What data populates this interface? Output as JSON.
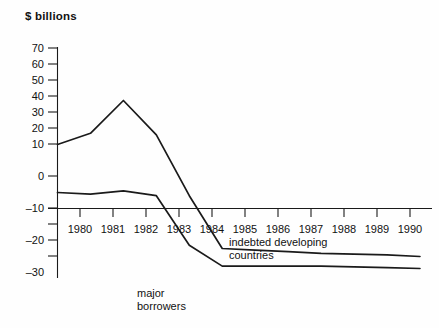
{
  "chart_data": {
    "type": "line",
    "title": "",
    "ylabel": "$ billions",
    "xlabel": "",
    "ylim": [
      -40,
      72
    ],
    "xlim": [
      1979,
      1990
    ],
    "grid": false,
    "legend": "inline-annotations",
    "yticks": [
      70,
      60,
      50,
      40,
      30,
      20,
      10,
      0,
      -10,
      -20,
      -30
    ],
    "ytick_labels": [
      "70",
      "60",
      "50",
      "40",
      "30",
      "20",
      "10",
      "0",
      "–10",
      "–20",
      "–30"
    ],
    "xticks": [
      1980,
      1981,
      1982,
      1983,
      1984,
      1985,
      1986,
      1987,
      1988,
      1989,
      1990
    ],
    "xtick_labels": [
      "1980",
      "1981",
      "1982",
      "1983",
      "1984",
      "1985",
      "1986",
      "1987",
      "1988",
      "1989",
      "1990"
    ],
    "x": [
      1979,
      1980,
      1981,
      1982,
      1983,
      1984,
      1985,
      1986,
      1987,
      1988,
      1989,
      1990
    ],
    "series": [
      {
        "name": "indebted developing countries",
        "values": [
          40,
          47,
          67.5,
          46,
          8,
          -25,
          -26,
          -27,
          -28,
          -28.5,
          -29,
          -30
        ]
      },
      {
        "name": "major borrowers",
        "values": [
          10,
          9,
          11,
          8,
          -23,
          -36,
          -36,
          -36,
          -36,
          -36.5,
          -37,
          -37.5
        ]
      }
    ],
    "annotations": [
      {
        "id": "indebted-developing-countries",
        "line1": "indebted developing",
        "line2": "countries"
      },
      {
        "id": "major-borrowers",
        "line1": "major",
        "line2": "borrowers"
      }
    ],
    "colors": {
      "line": "#1a1a1a",
      "axis": "#1a1a1a",
      "text": "#111111",
      "background": "#fefefe"
    }
  }
}
